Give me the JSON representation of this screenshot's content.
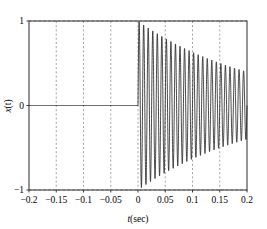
{
  "chart_data": {
    "type": "line",
    "title": "",
    "xlabel": "t(sec)",
    "ylabel": "x(t)",
    "xlim": [
      -0.2,
      0.2
    ],
    "ylim": [
      -1,
      1
    ],
    "grid": true,
    "grid_style": "dashed",
    "legend": null,
    "xticks": [
      -0.2,
      -0.15,
      -0.1,
      -0.05,
      0,
      0.05,
      0.1,
      0.15,
      0.2
    ],
    "xticklabels": [
      "−0.2",
      "−0.15",
      "−0.1",
      "−0.05",
      "0",
      "0.05",
      "0.1",
      "0.15",
      "0.2"
    ],
    "yticks": [
      -1,
      0,
      1
    ],
    "yticklabels": [
      "−1",
      "0",
      "1"
    ],
    "series": [
      {
        "name": "x(t)",
        "color": "#1a1a1a",
        "linewidth": 0.8,
        "model": {
          "kind": "damped_sine_step",
          "amplitude": 1.0,
          "decay_rate": 4.6,
          "frequency_hz": 120,
          "phase_deg": 0,
          "onset_t": 0.0
        },
        "envelope_samples": [
          {
            "t": 0.0,
            "peak": 1.0
          },
          {
            "t": 0.025,
            "peak": 0.89
          },
          {
            "t": 0.05,
            "peak": 0.79
          },
          {
            "t": 0.075,
            "peak": 0.71
          },
          {
            "t": 0.1,
            "peak": 0.63
          },
          {
            "t": 0.125,
            "peak": 0.56
          },
          {
            "t": 0.15,
            "peak": 0.5
          },
          {
            "t": 0.175,
            "peak": 0.45
          },
          {
            "t": 0.2,
            "peak": 0.4
          }
        ]
      }
    ]
  },
  "axes": {
    "xlabel_italic": "t",
    "xlabel_rest": "(sec)",
    "ylabel_italic": "x",
    "ylabel_rest": "(t)"
  },
  "colors": {
    "axis": "#3c3c3c",
    "grid": "#8c8c8c",
    "curve": "#1a1a1a",
    "background": "#ffffff",
    "text": "#000000"
  }
}
